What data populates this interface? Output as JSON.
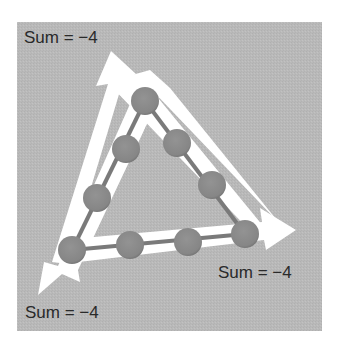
{
  "figure": {
    "background_color": "#b9b9b9",
    "panel": {
      "x": 17,
      "y": 22,
      "width": 305,
      "height": 309
    },
    "arrow_color": "#ffffff",
    "node_color": "#8a8a8a",
    "edge_color": "#7a7a7a",
    "node_radius": 14
  },
  "labels": {
    "top_left": "Sum = −4",
    "right": "Sum = −4",
    "bottom_left": "Sum = −4"
  },
  "triangle": {
    "corners": {
      "top": {
        "x": 145,
        "y": 101
      },
      "bottom_left": {
        "x": 72,
        "y": 250
      },
      "bottom_right": {
        "x": 245,
        "y": 234
      }
    },
    "side_nodes": {
      "left": [
        {
          "x": 126,
          "y": 149
        },
        {
          "x": 97,
          "y": 198
        }
      ],
      "right": [
        {
          "x": 177,
          "y": 143
        },
        {
          "x": 212,
          "y": 185
        }
      ],
      "bottom": [
        {
          "x": 130,
          "y": 245
        },
        {
          "x": 188,
          "y": 242
        }
      ]
    },
    "node_count": 9,
    "side_sum": -4
  },
  "arrows": [
    {
      "name": "left-side-arrow",
      "direction": "up",
      "tip": {
        "x": 111,
        "y": 51
      }
    },
    {
      "name": "bottom-side-arrow",
      "direction": "right",
      "tip": {
        "x": 296,
        "y": 230
      }
    },
    {
      "name": "right-side-arrow",
      "direction": "down-left",
      "tip": {
        "x": 38,
        "y": 295
      }
    }
  ]
}
